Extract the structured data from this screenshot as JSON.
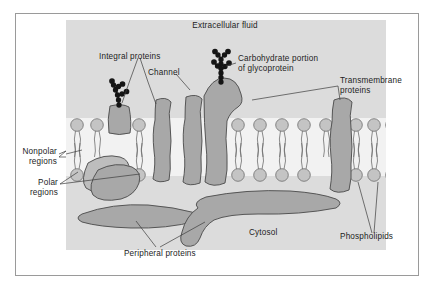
{
  "figure": {
    "background_color": "#ffffff",
    "panel_color": "#dcdcdc",
    "membrane_interior_color": "#f2f2f2",
    "protein_fill_color": "#a8a8a8",
    "protein_stroke_color": "#4a4a4a",
    "phospholipid_head_color": "#c4c4c4",
    "phospholipid_stroke_color": "#6e6e6e",
    "carbohydrate_color": "#151515",
    "leader_line_color": "#3c3c3c",
    "frame_border_color": "#9a9a9a",
    "text_color": "#1c1c1c"
  },
  "labels": {
    "extracellular_fluid": "Extracellular fluid",
    "integral_proteins": "Integral proteins",
    "channel": "Channel",
    "carbohydrate_line1": "Carbohydrate portion",
    "carbohydrate_line2": "of glycoprotein",
    "transmembrane_line1": "Transmembrane",
    "transmembrane_line2": "proteins",
    "nonpolar_line1": "Nonpolar",
    "nonpolar_line2": "regions",
    "polar_line1": "Polar",
    "polar_line2": "regions",
    "cytosol": "Cytosol",
    "phospholipids": "Phospholipids",
    "peripheral_proteins": "Peripheral proteins"
  },
  "structures": {
    "phospholipid_bilayer": {
      "name": "phospholipid bilayer",
      "upper_leaflet_head_count": 13,
      "lower_leaflet_head_count": 13,
      "tails_per_lipid": 2
    },
    "membrane_proteins": [
      {
        "name": "integral protein with glycoprotein",
        "type": "integral"
      },
      {
        "name": "channel protein left",
        "type": "channel"
      },
      {
        "name": "channel protein right",
        "type": "channel"
      },
      {
        "name": "glycoprotein transmembrane",
        "type": "transmembrane"
      },
      {
        "name": "transmembrane protein right",
        "type": "transmembrane"
      },
      {
        "name": "peripheral protein upper left",
        "type": "peripheral"
      },
      {
        "name": "peripheral protein lower left",
        "type": "peripheral"
      },
      {
        "name": "peripheral protein lower right",
        "type": "peripheral"
      }
    ],
    "carbohydrate_chains": [
      {
        "name": "glycoprotein chain left",
        "bead_count": 13
      },
      {
        "name": "glycoprotein chain center",
        "bead_count": 17
      }
    ]
  }
}
